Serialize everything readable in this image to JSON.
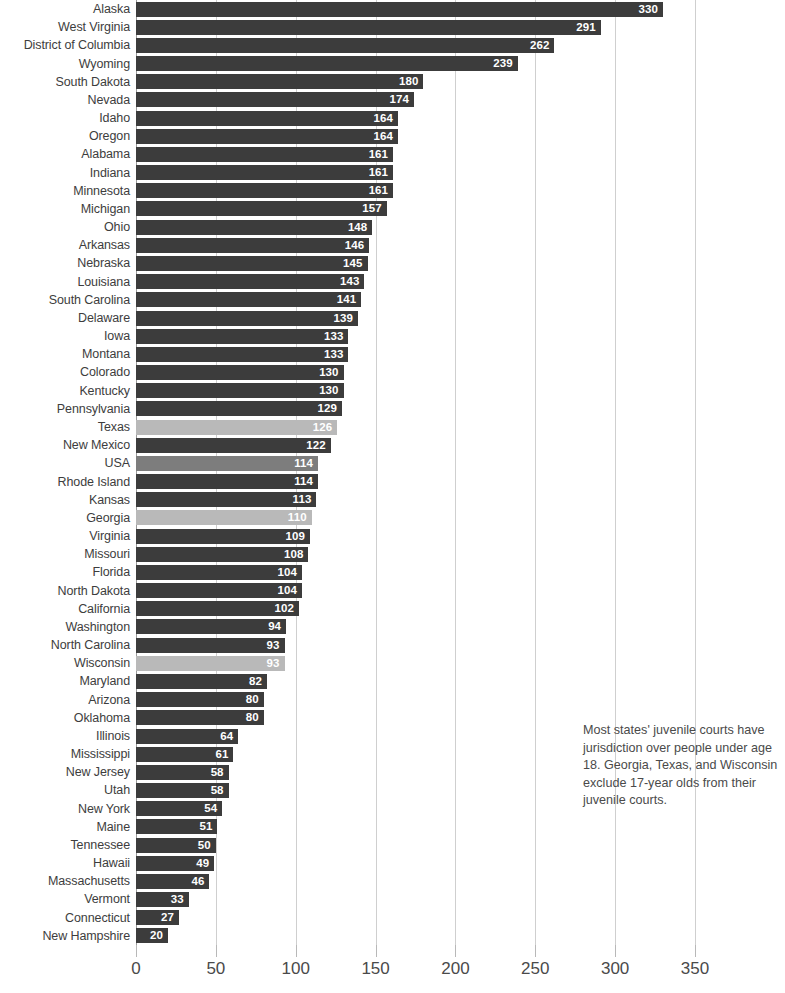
{
  "chart_data": {
    "type": "bar",
    "orientation": "horizontal",
    "title": "",
    "subtitle": "",
    "xlabel": "",
    "ylabel": "",
    "xlim": [
      0,
      350
    ],
    "xticks": [
      0,
      50,
      100,
      150,
      200,
      250,
      300,
      350
    ],
    "xtick_labels": [
      "0",
      "50",
      "100",
      "150",
      "200",
      "250",
      "300",
      "350"
    ],
    "grid": true,
    "legend": "none",
    "categories": [
      "Alaska",
      "West Virginia",
      "District of Columbia",
      "Wyoming",
      "South Dakota",
      "Nevada",
      "Idaho",
      "Oregon",
      "Alabama",
      "Indiana",
      "Minnesota",
      "Michigan",
      "Ohio",
      "Arkansas",
      "Nebraska",
      "Louisiana",
      "South Carolina",
      "Delaware",
      "Iowa",
      "Montana",
      "Colorado",
      "Kentucky",
      "Pennsylvania",
      "Texas",
      "New Mexico",
      "USA",
      "Rhode Island",
      "Kansas",
      "Georgia",
      "Virginia",
      "Missouri",
      "Florida",
      "North Dakota",
      "California",
      "Washington",
      "North Carolina",
      "Wisconsin",
      "Maryland",
      "Arizona",
      "Oklahoma",
      "Illinois",
      "Mississippi",
      "New Jersey",
      "Utah",
      "New York",
      "Maine",
      "Tennessee",
      "Hawaii",
      "Massachusetts",
      "Vermont",
      "Connecticut",
      "New Hampshire"
    ],
    "values": [
      330,
      291,
      262,
      239,
      180,
      174,
      164,
      164,
      161,
      161,
      161,
      157,
      148,
      146,
      145,
      143,
      141,
      139,
      133,
      133,
      130,
      130,
      129,
      126,
      122,
      114,
      114,
      113,
      110,
      109,
      108,
      104,
      104,
      102,
      94,
      93,
      93,
      82,
      80,
      80,
      64,
      61,
      58,
      58,
      54,
      51,
      50,
      49,
      46,
      33,
      27,
      20
    ],
    "bar_styles": [
      "dark",
      "dark",
      "dark",
      "dark",
      "dark",
      "dark",
      "dark",
      "dark",
      "dark",
      "dark",
      "dark",
      "dark",
      "dark",
      "dark",
      "dark",
      "dark",
      "dark",
      "dark",
      "dark",
      "dark",
      "dark",
      "dark",
      "dark",
      "highlight",
      "dark",
      "usa",
      "dark",
      "dark",
      "highlight",
      "dark",
      "dark",
      "dark",
      "dark",
      "dark",
      "dark",
      "dark",
      "highlight",
      "dark",
      "dark",
      "dark",
      "dark",
      "dark",
      "dark",
      "dark",
      "dark",
      "dark",
      "dark",
      "dark",
      "dark",
      "dark",
      "dark",
      "dark"
    ],
    "colors": {
      "bar_dark": "#3c3c3c",
      "bar_highlight": "#b9b9b9",
      "bar_usa": "#7d7d7d",
      "gridline": "#cfcfcf",
      "axis": "#9a9a9a",
      "text": "#3d3d3d",
      "value_label": "#ffffff",
      "background": "#ffffff"
    },
    "annotations": [
      {
        "name": "jurisdiction-note",
        "text": "Most states' juvenile courts have jurisdiction over people under age 18. Georgia, Texas, and Wisconsin exclude 17-year olds from their juvenile courts."
      }
    ]
  }
}
